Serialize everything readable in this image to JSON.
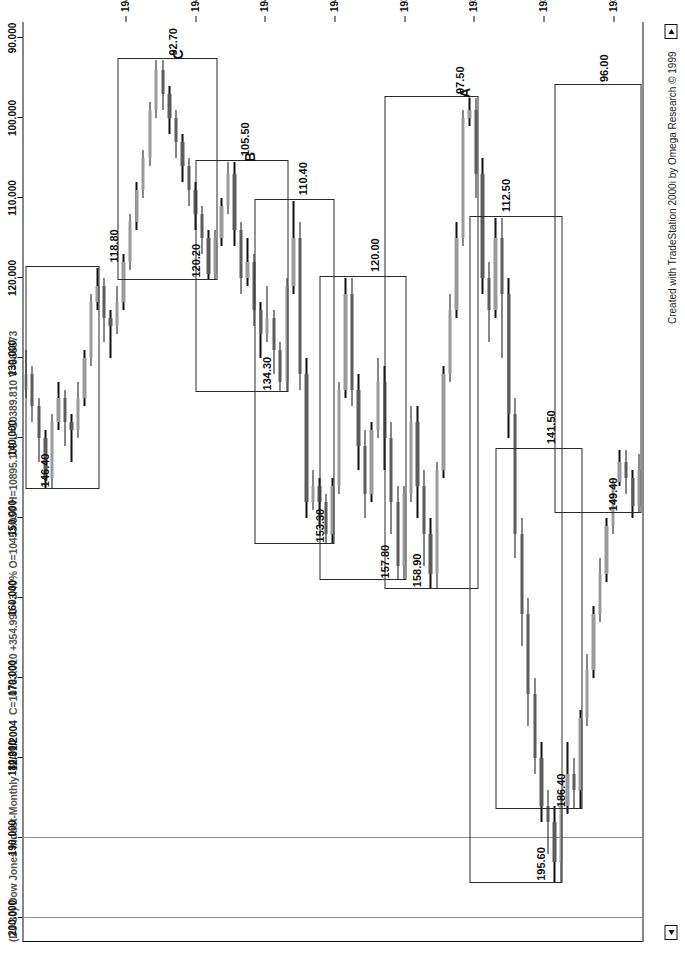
{
  "window": {
    "title_bar": "(DJ-30) Dow Jones Indust-Monthly",
    "date": "12/31/2004",
    "quote": "C=10783.010 +354.990 +3.40%  O=10453.050  H=10895.100  L=10389.810  V=566673",
    "credit": "Created with TradeStation 2000i by Omega Research © 1999",
    "scroll_left_icon": "left-arrow-icon",
    "scroll_right_icon": "right-arrow-icon"
  },
  "chart_data": {
    "type": "candlestick",
    "title": "(DJ-30) Dow Jones Indust-Monthly",
    "subtitle": "12/31/2004 C=10783.010 +354.990 +3.40% O=10453.050 H=10895.100 L=10389.810 V=566673",
    "xlabel": "",
    "ylabel": "",
    "grid": true,
    "legend": "none",
    "ylim": [
      88,
      203
    ],
    "yticks": [
      200.0,
      190.0,
      180.0,
      170.0,
      160.0,
      150.0,
      140.0,
      130.0,
      120.0,
      110.0,
      100.0,
      90.0
    ],
    "ytick_labels": [
      "200.000",
      "190.000",
      "180.000",
      "170.000",
      "160.000",
      "150.000",
      "140.000",
      "130.000",
      "120.000",
      "110.000",
      "100.000",
      "90.000"
    ],
    "xticks": [
      "1936",
      "1937",
      "1938",
      "1939",
      "1940",
      "1941",
      "1942",
      "1943"
    ],
    "up_color": "#9b9b9b",
    "down_color": "#5c5c5c",
    "annotations": [
      {
        "label": "195.60",
        "kind": "swing-high"
      },
      {
        "label": "186.40",
        "kind": "swing-high"
      },
      {
        "label": "149.40",
        "kind": "swing-high"
      },
      {
        "label": "141.50",
        "kind": "swing-low"
      },
      {
        "label": "96.00",
        "kind": "swing-low"
      },
      {
        "label": "112.50",
        "kind": "swing-low"
      },
      {
        "label": "158.90",
        "kind": "swing-high"
      },
      {
        "label": "97.50",
        "kind": "swing-low"
      },
      {
        "label": "157.80",
        "kind": "swing-high"
      },
      {
        "label": "120.00",
        "kind": "swing-low"
      },
      {
        "label": "153.30",
        "kind": "swing-high"
      },
      {
        "label": "110.40",
        "kind": "swing-low"
      },
      {
        "label": "134.30",
        "kind": "swing-high"
      },
      {
        "label": "105.50",
        "kind": "swing-low"
      },
      {
        "label": "120.20",
        "kind": "swing-high"
      },
      {
        "label": "92.70",
        "kind": "swing-low"
      },
      {
        "label": "146.40",
        "kind": "swing-high"
      },
      {
        "label": "118.80",
        "kind": "swing-low"
      },
      {
        "label": "A",
        "kind": "wave-letter"
      },
      {
        "label": "B",
        "kind": "wave-letter"
      },
      {
        "label": "C",
        "kind": "wave-letter"
      }
    ],
    "bars": [
      {
        "t": 0.0,
        "o": 144.0,
        "h": 149.4,
        "l": 142.0,
        "c": 148.5,
        "dir": "up"
      },
      {
        "t": 1.0,
        "o": 148.5,
        "h": 150.0,
        "l": 144.0,
        "c": 145.0,
        "dir": "down"
      },
      {
        "t": 2.0,
        "o": 145.0,
        "h": 147.0,
        "l": 141.5,
        "c": 143.0,
        "dir": "down"
      },
      {
        "t": 3.0,
        "o": 143.0,
        "h": 146.0,
        "l": 141.5,
        "c": 145.5,
        "dir": "up"
      },
      {
        "t": 4.0,
        "o": 145.5,
        "h": 152.0,
        "l": 145.0,
        "c": 151.0,
        "dir": "up"
      },
      {
        "t": 5.0,
        "o": 151.0,
        "h": 158.0,
        "l": 150.0,
        "c": 157.0,
        "dir": "up"
      },
      {
        "t": 6.0,
        "o": 157.0,
        "h": 163.0,
        "l": 155.0,
        "c": 162.0,
        "dir": "up"
      },
      {
        "t": 7.0,
        "o": 162.0,
        "h": 170.0,
        "l": 161.0,
        "c": 169.0,
        "dir": "up"
      },
      {
        "t": 8.0,
        "o": 169.0,
        "h": 176.0,
        "l": 167.0,
        "c": 175.0,
        "dir": "up"
      },
      {
        "t": 9.0,
        "o": 175.0,
        "h": 186.4,
        "l": 174.0,
        "c": 184.0,
        "dir": "up"
      },
      {
        "t": 10.0,
        "o": 184.0,
        "h": 186.4,
        "l": 180.0,
        "c": 182.0,
        "dir": "down"
      },
      {
        "t": 11.0,
        "o": 182.0,
        "h": 187.0,
        "l": 178.0,
        "c": 186.0,
        "dir": "up"
      },
      {
        "t": 12.0,
        "o": 186.0,
        "h": 195.6,
        "l": 184.0,
        "c": 193.0,
        "dir": "up"
      },
      {
        "t": 13.0,
        "o": 193.0,
        "h": 195.6,
        "l": 186.0,
        "c": 188.0,
        "dir": "down"
      },
      {
        "t": 14.0,
        "o": 188.0,
        "h": 192.0,
        "l": 184.0,
        "c": 186.0,
        "dir": "down"
      },
      {
        "t": 15.0,
        "o": 186.0,
        "h": 188.0,
        "l": 178.0,
        "c": 180.0,
        "dir": "down"
      },
      {
        "t": 16.0,
        "o": 180.0,
        "h": 182.0,
        "l": 170.0,
        "c": 172.0,
        "dir": "down"
      },
      {
        "t": 17.0,
        "o": 172.0,
        "h": 176.0,
        "l": 160.0,
        "c": 162.0,
        "dir": "down"
      },
      {
        "t": 18.0,
        "o": 162.0,
        "h": 166.0,
        "l": 150.0,
        "c": 152.0,
        "dir": "down"
      },
      {
        "t": 19.0,
        "o": 152.0,
        "h": 155.0,
        "l": 135.0,
        "c": 137.0,
        "dir": "down"
      },
      {
        "t": 20.0,
        "o": 137.0,
        "h": 140.0,
        "l": 120.0,
        "c": 122.0,
        "dir": "down"
      },
      {
        "t": 21.0,
        "o": 122.0,
        "h": 130.0,
        "l": 112.5,
        "c": 115.0,
        "dir": "down"
      },
      {
        "t": 22.0,
        "o": 115.0,
        "h": 125.0,
        "l": 112.5,
        "c": 124.0,
        "dir": "up"
      },
      {
        "t": 23.0,
        "o": 124.0,
        "h": 128.0,
        "l": 118.0,
        "c": 120.0,
        "dir": "down"
      },
      {
        "t": 24.0,
        "o": 120.0,
        "h": 122.0,
        "l": 105.0,
        "c": 107.0,
        "dir": "down"
      },
      {
        "t": 25.0,
        "o": 107.0,
        "h": 110.0,
        "l": 97.5,
        "c": 99.0,
        "dir": "down"
      },
      {
        "t": 26.0,
        "o": 99.0,
        "h": 101.0,
        "l": 97.5,
        "c": 100.0,
        "dir": "up"
      },
      {
        "t": 27.0,
        "o": 100.0,
        "h": 116.0,
        "l": 99.0,
        "c": 115.0,
        "dir": "up"
      },
      {
        "t": 28.0,
        "o": 115.0,
        "h": 125.0,
        "l": 113.0,
        "c": 124.0,
        "dir": "up"
      },
      {
        "t": 29.0,
        "o": 124.0,
        "h": 133.0,
        "l": 122.0,
        "c": 132.0,
        "dir": "up"
      },
      {
        "t": 30.0,
        "o": 132.0,
        "h": 145.0,
        "l": 131.0,
        "c": 144.0,
        "dir": "up"
      },
      {
        "t": 31.0,
        "o": 144.0,
        "h": 158.9,
        "l": 143.0,
        "c": 157.0,
        "dir": "up"
      },
      {
        "t": 32.0,
        "o": 157.0,
        "h": 158.9,
        "l": 150.0,
        "c": 152.0,
        "dir": "down"
      },
      {
        "t": 33.0,
        "o": 152.0,
        "h": 156.0,
        "l": 144.0,
        "c": 146.0,
        "dir": "down"
      },
      {
        "t": 34.0,
        "o": 146.0,
        "h": 150.0,
        "l": 136.0,
        "c": 138.0,
        "dir": "down"
      },
      {
        "t": 35.0,
        "o": 138.0,
        "h": 148.0,
        "l": 136.0,
        "c": 147.0,
        "dir": "up"
      },
      {
        "t": 36.0,
        "o": 147.0,
        "h": 157.8,
        "l": 146.0,
        "c": 156.0,
        "dir": "up"
      },
      {
        "t": 37.0,
        "o": 156.0,
        "h": 157.8,
        "l": 146.0,
        "c": 148.0,
        "dir": "down"
      },
      {
        "t": 38.0,
        "o": 148.0,
        "h": 152.0,
        "l": 138.0,
        "c": 140.0,
        "dir": "down"
      },
      {
        "t": 39.0,
        "o": 140.0,
        "h": 144.0,
        "l": 131.0,
        "c": 133.0,
        "dir": "down"
      },
      {
        "t": 40.0,
        "o": 133.0,
        "h": 140.0,
        "l": 130.0,
        "c": 139.0,
        "dir": "up"
      },
      {
        "t": 41.0,
        "o": 139.0,
        "h": 148.0,
        "l": 138.0,
        "c": 147.0,
        "dir": "up"
      },
      {
        "t": 42.0,
        "o": 147.0,
        "h": 150.0,
        "l": 139.0,
        "c": 141.0,
        "dir": "down"
      },
      {
        "t": 43.0,
        "o": 141.0,
        "h": 144.0,
        "l": 132.0,
        "c": 134.0,
        "dir": "down"
      },
      {
        "t": 44.0,
        "o": 134.0,
        "h": 136.0,
        "l": 120.0,
        "c": 122.0,
        "dir": "down"
      },
      {
        "t": 45.0,
        "o": 122.0,
        "h": 135.0,
        "l": 120.0,
        "c": 134.0,
        "dir": "up"
      },
      {
        "t": 46.0,
        "o": 134.0,
        "h": 147.0,
        "l": 133.0,
        "c": 146.0,
        "dir": "up"
      },
      {
        "t": 47.0,
        "o": 146.0,
        "h": 153.3,
        "l": 145.0,
        "c": 152.0,
        "dir": "up"
      },
      {
        "t": 48.0,
        "o": 152.0,
        "h": 153.3,
        "l": 147.0,
        "c": 148.0,
        "dir": "down"
      },
      {
        "t": 49.0,
        "o": 148.0,
        "h": 151.0,
        "l": 145.0,
        "c": 146.0,
        "dir": "down"
      },
      {
        "t": 50.0,
        "o": 146.0,
        "h": 149.0,
        "l": 144.0,
        "c": 148.0,
        "dir": "up"
      },
      {
        "t": 51.0,
        "o": 148.0,
        "h": 150.0,
        "l": 130.0,
        "c": 132.0,
        "dir": "down"
      },
      {
        "t": 52.0,
        "o": 132.0,
        "h": 134.0,
        "l": 113.0,
        "c": 115.0,
        "dir": "down"
      },
      {
        "t": 53.0,
        "o": 115.0,
        "h": 122.0,
        "l": 110.4,
        "c": 121.0,
        "dir": "up"
      },
      {
        "t": 54.0,
        "o": 121.0,
        "h": 134.3,
        "l": 120.0,
        "c": 133.0,
        "dir": "up"
      },
      {
        "t": 55.0,
        "o": 133.0,
        "h": 134.3,
        "l": 128.0,
        "c": 129.0,
        "dir": "down"
      },
      {
        "t": 56.0,
        "o": 129.0,
        "h": 132.0,
        "l": 124.0,
        "c": 125.0,
        "dir": "down"
      },
      {
        "t": 57.0,
        "o": 125.0,
        "h": 128.0,
        "l": 121.0,
        "c": 127.0,
        "dir": "up"
      },
      {
        "t": 58.0,
        "o": 127.0,
        "h": 130.0,
        "l": 123.0,
        "c": 124.0,
        "dir": "down"
      },
      {
        "t": 59.0,
        "o": 124.0,
        "h": 126.0,
        "l": 117.0,
        "c": 118.0,
        "dir": "down"
      },
      {
        "t": 60.0,
        "o": 118.0,
        "h": 121.0,
        "l": 115.0,
        "c": 120.0,
        "dir": "up"
      },
      {
        "t": 61.0,
        "o": 120.0,
        "h": 122.0,
        "l": 113.0,
        "c": 114.0,
        "dir": "down"
      },
      {
        "t": 62.0,
        "o": 114.0,
        "h": 116.0,
        "l": 105.5,
        "c": 107.0,
        "dir": "down"
      },
      {
        "t": 63.0,
        "o": 107.0,
        "h": 112.0,
        "l": 105.5,
        "c": 111.0,
        "dir": "up"
      },
      {
        "t": 64.0,
        "o": 111.0,
        "h": 116.0,
        "l": 110.0,
        "c": 115.0,
        "dir": "up"
      },
      {
        "t": 65.0,
        "o": 115.0,
        "h": 120.2,
        "l": 114.0,
        "c": 119.5,
        "dir": "up"
      },
      {
        "t": 66.0,
        "o": 119.5,
        "h": 120.2,
        "l": 114.0,
        "c": 115.0,
        "dir": "down"
      },
      {
        "t": 67.0,
        "o": 115.0,
        "h": 117.0,
        "l": 111.0,
        "c": 112.0,
        "dir": "down"
      },
      {
        "t": 68.0,
        "o": 112.0,
        "h": 114.0,
        "l": 108.0,
        "c": 109.0,
        "dir": "down"
      },
      {
        "t": 69.0,
        "o": 109.0,
        "h": 111.0,
        "l": 105.0,
        "c": 106.0,
        "dir": "down"
      },
      {
        "t": 70.0,
        "o": 106.0,
        "h": 108.0,
        "l": 102.0,
        "c": 103.0,
        "dir": "down"
      },
      {
        "t": 71.0,
        "o": 103.0,
        "h": 105.0,
        "l": 99.0,
        "c": 100.0,
        "dir": "down"
      },
      {
        "t": 72.0,
        "o": 100.0,
        "h": 102.0,
        "l": 96.0,
        "c": 97.0,
        "dir": "down"
      },
      {
        "t": 73.0,
        "o": 97.0,
        "h": 99.0,
        "l": 92.7,
        "c": 94.0,
        "dir": "down"
      },
      {
        "t": 74.0,
        "o": 94.0,
        "h": 100.0,
        "l": 92.7,
        "c": 99.0,
        "dir": "up"
      },
      {
        "t": 75.0,
        "o": 99.0,
        "h": 106.0,
        "l": 98.0,
        "c": 105.0,
        "dir": "up"
      },
      {
        "t": 76.0,
        "o": 105.0,
        "h": 110.0,
        "l": 104.0,
        "c": 109.0,
        "dir": "up"
      },
      {
        "t": 77.0,
        "o": 109.0,
        "h": 114.0,
        "l": 108.0,
        "c": 113.0,
        "dir": "up"
      },
      {
        "t": 78.0,
        "o": 113.0,
        "h": 119.0,
        "l": 112.0,
        "c": 118.0,
        "dir": "up"
      },
      {
        "t": 79.0,
        "o": 118.0,
        "h": 124.0,
        "l": 117.0,
        "c": 123.0,
        "dir": "up"
      },
      {
        "t": 80.0,
        "o": 123.0,
        "h": 127.0,
        "l": 121.0,
        "c": 126.0,
        "dir": "up"
      },
      {
        "t": 81.0,
        "o": 126.0,
        "h": 130.0,
        "l": 124.0,
        "c": 125.0,
        "dir": "down"
      },
      {
        "t": 82.0,
        "o": 125.0,
        "h": 128.0,
        "l": 120.0,
        "c": 121.0,
        "dir": "down"
      },
      {
        "t": 83.0,
        "o": 121.0,
        "h": 124.0,
        "l": 118.8,
        "c": 123.0,
        "dir": "up"
      },
      {
        "t": 84.0,
        "o": 123.0,
        "h": 131.0,
        "l": 122.0,
        "c": 130.0,
        "dir": "up"
      },
      {
        "t": 85.0,
        "o": 130.0,
        "h": 136.0,
        "l": 129.0,
        "c": 135.0,
        "dir": "up"
      },
      {
        "t": 86.0,
        "o": 135.0,
        "h": 140.0,
        "l": 133.0,
        "c": 139.0,
        "dir": "up"
      },
      {
        "t": 87.0,
        "o": 139.0,
        "h": 143.0,
        "l": 137.0,
        "c": 138.0,
        "dir": "down"
      },
      {
        "t": 88.0,
        "o": 138.0,
        "h": 141.0,
        "l": 134.0,
        "c": 135.0,
        "dir": "down"
      },
      {
        "t": 89.0,
        "o": 135.0,
        "h": 139.0,
        "l": 133.0,
        "c": 138.0,
        "dir": "up"
      },
      {
        "t": 90.0,
        "o": 138.0,
        "h": 146.4,
        "l": 137.0,
        "c": 145.0,
        "dir": "up"
      },
      {
        "t": 91.0,
        "o": 145.0,
        "h": 146.4,
        "l": 139.0,
        "c": 140.0,
        "dir": "down"
      },
      {
        "t": 92.0,
        "o": 140.0,
        "h": 143.0,
        "l": 135.0,
        "c": 136.0,
        "dir": "down"
      },
      {
        "t": 93.0,
        "o": 136.0,
        "h": 138.0,
        "l": 131.0,
        "c": 132.0,
        "dir": "down"
      },
      {
        "t": 94.0,
        "o": 132.0,
        "h": 135.0,
        "l": 129.0,
        "c": 134.0,
        "dir": "up"
      }
    ]
  }
}
